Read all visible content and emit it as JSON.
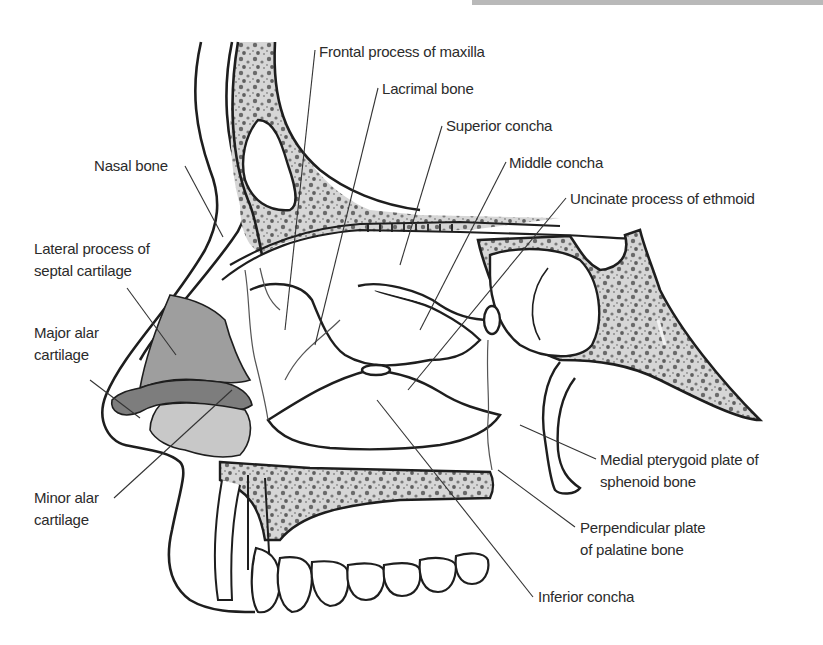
{
  "figure": {
    "colors": {
      "background": "#ffffff",
      "outline": "#1e1e1e",
      "leader": "#333333",
      "lateral_cartilage_fill": "#9e9e9e",
      "major_alar_fill": "#7d7d7d",
      "minor_alar_fill": "#c8c8c8",
      "spongy_bone_fill": "#cfcfcf",
      "top_bar": "#b9b9b9"
    },
    "labels": {
      "frontal_process": "Frontal process of maxilla",
      "lacrimal_bone": "Lacrimal bone",
      "superior_concha": "Superior concha",
      "middle_concha": "Middle concha",
      "uncinate_process": "Uncinate process of ethmoid",
      "nasal_bone": "Nasal bone",
      "lateral_process_line1": "Lateral process of",
      "lateral_process_line2": "septal cartilage",
      "major_alar_line1": "Major alar",
      "major_alar_line2": "cartilage",
      "minor_alar_line1": "Minor alar",
      "minor_alar_line2": "cartilage",
      "medial_pterygoid_line1": "Medial pterygoid plate of",
      "medial_pterygoid_line2": "sphenoid bone",
      "perpendicular_plate_line1": "Perpendicular plate",
      "perpendicular_plate_line2": "of palatine bone",
      "inferior_concha": "Inferior concha"
    }
  }
}
